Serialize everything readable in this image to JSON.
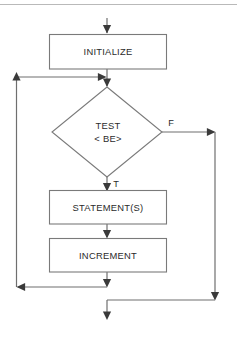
{
  "figure": {
    "kind": "flowchart",
    "colors": {
      "background": "#ffffff",
      "shape_stroke": "#7a7a7a",
      "line_stroke": "#6f6f6f",
      "arrow_fill": "#3a3a3a",
      "text": "#2b2b2b",
      "top_rule": "#b9b9b9"
    },
    "nodes": [
      {
        "id": "initialize",
        "type": "process",
        "label": "INITIALIZE"
      },
      {
        "id": "test",
        "type": "decision",
        "label_line1": "TEST",
        "label_line2": "< BE>"
      },
      {
        "id": "statements",
        "type": "process",
        "label": "STATEMENT(S)"
      },
      {
        "id": "increment",
        "type": "process",
        "label": "INCREMENT"
      }
    ],
    "branch_labels": {
      "false": "F",
      "true": "T"
    }
  }
}
